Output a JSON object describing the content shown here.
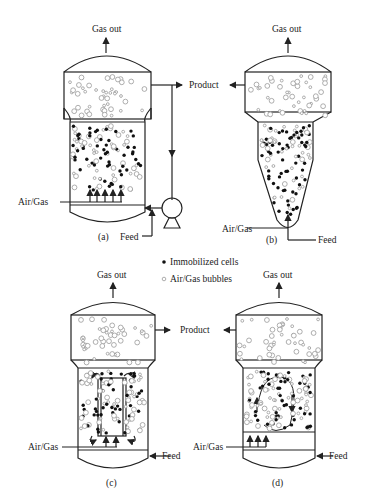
{
  "figure": {
    "panels": [
      {
        "id": "a",
        "caption": "(a)",
        "gas_out": "Gas out",
        "product": "Product",
        "air_gas": "Air/Gas",
        "feed": "Feed"
      },
      {
        "id": "b",
        "caption": "(b)",
        "gas_out": "Gas out",
        "product": "Product",
        "air_gas": "Air/Gas",
        "feed": "Feed"
      },
      {
        "id": "c",
        "caption": "(c)",
        "gas_out": "Gas out",
        "product": "Product",
        "air_gas": "Air/Gas",
        "feed": "Feed"
      },
      {
        "id": "d",
        "caption": "(d)",
        "gas_out": "Gas out",
        "product": "Product",
        "air_gas": "Air/Gas",
        "feed": "Feed"
      }
    ],
    "legend": {
      "items": [
        {
          "label": "Immobilized cells",
          "marker": "filled-dot",
          "color": "#111111"
        },
        {
          "label": "Air/Gas bubbles",
          "marker": "hollow-dot",
          "color": "#999999"
        }
      ]
    },
    "colors": {
      "line": "#222222",
      "cell": "#111111",
      "bubble": "#999999",
      "background": "#ffffff"
    }
  }
}
